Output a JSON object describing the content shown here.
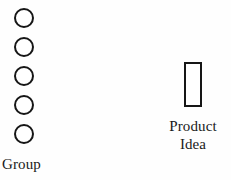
{
  "diagram": {
    "background_color": "#fefefe",
    "stroke_color": "#161616",
    "text_color": "#1a1a1a",
    "group": {
      "label": "Group",
      "node_count": 5,
      "node_shape": "circle",
      "nodes": [
        {
          "name": "group-node-1"
        },
        {
          "name": "group-node-2"
        },
        {
          "name": "group-node-3"
        },
        {
          "name": "group-node-4"
        },
        {
          "name": "group-node-5"
        }
      ]
    },
    "product": {
      "shape": "rectangle",
      "label_line_1": "Product",
      "label_line_2": "Idea"
    }
  }
}
